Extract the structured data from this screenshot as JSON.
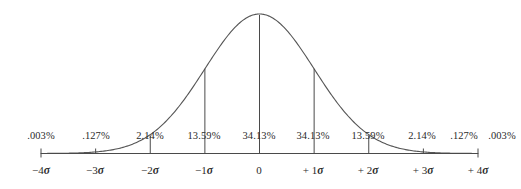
{
  "figure": {
    "background_color": "#ffffff",
    "curve_color": "#555555",
    "line_color": "#4a4a4a",
    "text_color": "#2b2b2b"
  },
  "chart_data": {
    "type": "area",
    "title": "",
    "subtitle": "",
    "xlabel": "",
    "ylabel": "",
    "grid": false,
    "legend": "none",
    "xlim": [
      -4,
      4
    ],
    "ylim": [
      0,
      1
    ],
    "x_tick_values": [
      -4,
      -3,
      -2,
      -1,
      0,
      1,
      2,
      3,
      4
    ],
    "x_tick_labels": [
      "−4σ",
      "−3σ",
      "−2σ",
      "−1σ",
      "0",
      "+ 1σ",
      "+ 2σ",
      "+ 3σ",
      "+ 4σ"
    ],
    "band_labels": [
      ".003%",
      ".127%",
      "2.14%",
      "13.59%",
      "34.13%",
      "34.13%",
      "13.59%",
      "2.14%",
      ".127%",
      ".003%"
    ],
    "band_values": [
      0.003,
      0.127,
      2.14,
      13.59,
      34.13,
      34.13,
      13.59,
      2.14,
      0.127,
      0.003
    ],
    "band_ranges": [
      [
        -5,
        -4
      ],
      [
        -4,
        -3
      ],
      [
        -3,
        -2
      ],
      [
        -2,
        -1
      ],
      [
        -1,
        0
      ],
      [
        0,
        1
      ],
      [
        1,
        2
      ],
      [
        2,
        3
      ],
      [
        3,
        4
      ],
      [
        4,
        5
      ]
    ],
    "curve": "standard normal probability density",
    "divider_sigmas": [
      -2,
      -1,
      0,
      1,
      2
    ]
  },
  "percent_labels": [
    {
      "text": ".003%",
      "x": 41,
      "sigma": -4.5
    },
    {
      "text": ".127%",
      "x": 96,
      "sigma": -3.5
    },
    {
      "text": "2.14%",
      "x": 150,
      "sigma": -2.5
    },
    {
      "text": "13.59%",
      "x": 204,
      "sigma": -1.5
    },
    {
      "text": "34.13%",
      "x": 259,
      "sigma": -0.5
    },
    {
      "text": "34.13%",
      "x": 313,
      "sigma": 0.5
    },
    {
      "text": "13.59%",
      "x": 368,
      "sigma": 1.5
    },
    {
      "text": "2.14%",
      "x": 422,
      "sigma": 2.5
    },
    {
      "text": ".127%",
      "x": 464,
      "sigma": 3.5
    },
    {
      "text": ".003%",
      "x": 502,
      "sigma": 4.5
    }
  ],
  "axis_labels": [
    {
      "sign": "−",
      "num": "4",
      "sigma": "σ",
      "x": 41
    },
    {
      "sign": "−",
      "num": "3",
      "sigma": "σ",
      "x": 95
    },
    {
      "sign": "−",
      "num": "2",
      "sigma": "σ",
      "x": 150
    },
    {
      "sign": "−",
      "num": "1",
      "sigma": "σ",
      "x": 204
    },
    {
      "sign": "",
      "num": "0",
      "sigma": "",
      "x": 259
    },
    {
      "sign": "+ ",
      "num": "1",
      "sigma": "σ",
      "x": 313
    },
    {
      "sign": "+ ",
      "num": "2",
      "sigma": "σ",
      "x": 368
    },
    {
      "sign": "+ ",
      "num": "3",
      "sigma": "σ",
      "x": 423
    },
    {
      "sign": "+ ",
      "num": "4",
      "sigma": "σ",
      "x": 478
    }
  ]
}
